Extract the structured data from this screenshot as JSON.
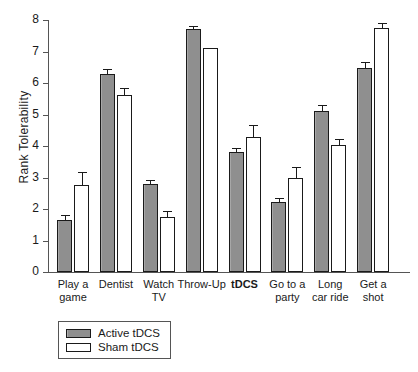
{
  "chart_data": {
    "type": "bar",
    "title": "",
    "xlabel": "",
    "ylabel": "Rank Tolerability",
    "ylim": [
      0,
      8
    ],
    "yticks": [
      0,
      1,
      2,
      3,
      4,
      5,
      6,
      7,
      8
    ],
    "ytick_labels": [
      "0",
      "1",
      "2",
      "3",
      "4",
      "5",
      "6",
      "7",
      "8"
    ],
    "grid": false,
    "legend_position": "below-axes-left",
    "categories": [
      "Play a game",
      "Dentist",
      "Watch TV",
      "Throw-Up",
      "tDCS",
      "Go to a party",
      "Long car ride",
      "Get a shot"
    ],
    "category_lines": [
      [
        "Play a",
        "game"
      ],
      [
        "Dentist",
        ""
      ],
      [
        "Watch",
        "TV"
      ],
      [
        "Throw-Up",
        ""
      ],
      [
        "tDCS",
        ""
      ],
      [
        "Go to a",
        "party"
      ],
      [
        "Long",
        "car ride"
      ],
      [
        "Get a",
        "shot"
      ]
    ],
    "highlighted_category": "tDCS",
    "series": [
      {
        "name": "Active tDCS",
        "color": "#8f8f8f",
        "values": [
          1.66,
          6.29,
          2.79,
          7.71,
          3.81,
          2.22,
          5.11,
          6.48
        ],
        "errors": [
          0.15,
          0.16,
          0.14,
          0.1,
          0.13,
          0.13,
          0.2,
          0.2
        ]
      },
      {
        "name": "Sham tDCS",
        "color": "#ffffff",
        "values": [
          2.76,
          5.62,
          1.75,
          7.11,
          4.29,
          2.98,
          4.03,
          7.75
        ],
        "errors": [
          0.4,
          0.21,
          0.2,
          0.0,
          0.39,
          0.36,
          0.18,
          0.14
        ]
      }
    ]
  },
  "legend": {
    "entries": [
      {
        "label": "Active tDCS"
      },
      {
        "label": "Sham tDCS"
      }
    ]
  }
}
